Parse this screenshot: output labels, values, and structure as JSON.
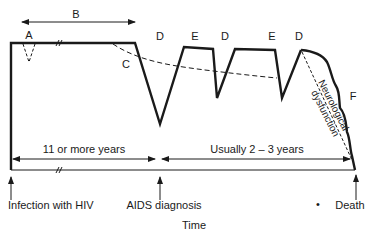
{
  "diagram": {
    "type": "disease-progression-timeline",
    "segment_labels": {
      "A": "A",
      "B": "B",
      "C": "C",
      "D1": "D",
      "E1": "E",
      "D2": "D",
      "E2": "E",
      "D3": "D",
      "F": "F"
    },
    "rotated_label": {
      "line1": "Neurological",
      "line2": "dysfunction"
    },
    "durations": {
      "first_period": "11 or more years",
      "second_period": "Usually 2 – 3 years"
    },
    "events": {
      "start": "Infection with HIV",
      "middle": "AIDS diagnosis",
      "end": "Death",
      "bullet": "•"
    },
    "x_axis_label": "Time",
    "colors": {
      "line": "#1a1a1a",
      "background": "#ffffff"
    }
  }
}
